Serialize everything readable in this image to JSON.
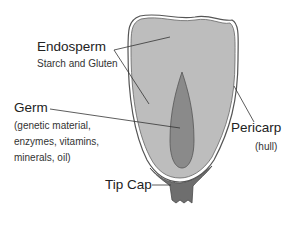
{
  "diagram": {
    "colors": {
      "background": "#ffffff",
      "endosperm": "#bdbdbd",
      "germ": "#8a8a8a",
      "tip_cap": "#6e6e6e",
      "outline": "#555555",
      "leader": "#333333"
    },
    "labels": {
      "endosperm": {
        "title": "Endosperm",
        "subtitle": "Starch and Gluten"
      },
      "germ": {
        "title": "Germ",
        "detail_lines": [
          "(genetic material,",
          "enzymes, vitamins,",
          "minerals, oil)"
        ]
      },
      "pericarp": {
        "title": "Pericarp",
        "subtitle": "(hull)"
      },
      "tip_cap": {
        "title": "Tip Cap"
      }
    }
  }
}
